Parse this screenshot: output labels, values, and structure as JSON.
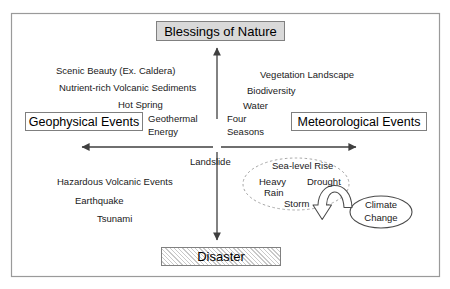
{
  "diagram": {
    "title_top": "Blessings of Nature",
    "title_bottom": "Disaster",
    "axis_left_label": "Geophysical Events",
    "axis_right_label": "Meteorological Events",
    "center_label": "Landslide",
    "quadrant_upper_left": [
      "Scenic Beauty (Ex. Caldera)",
      "Nutrient-rich Volcanic Sediments",
      "Hot Spring",
      "Geothermal",
      "Energy"
    ],
    "quadrant_upper_right": [
      "Vegetation Landscape",
      "Biodiversity",
      "Water",
      "Four",
      "Seasons"
    ],
    "quadrant_lower_left": [
      "Hazardous Volcanic Events",
      "Earthquake",
      "Tsunami"
    ],
    "quadrant_lower_right": [
      "Sea-level Rise",
      "Heavy",
      "Rain",
      "Drought",
      "Storm"
    ],
    "climate_ellipse": {
      "line1": "Climate",
      "line2": "Change"
    },
    "colors": {
      "frame": "#9a9a9a",
      "box_border": "#7f7f7f",
      "box_fill_gray": "#d9d9d9",
      "arrow": "#3f3f3f",
      "dashed_ellipse": "#a6a6a6",
      "text": "#1a1a1a"
    }
  }
}
